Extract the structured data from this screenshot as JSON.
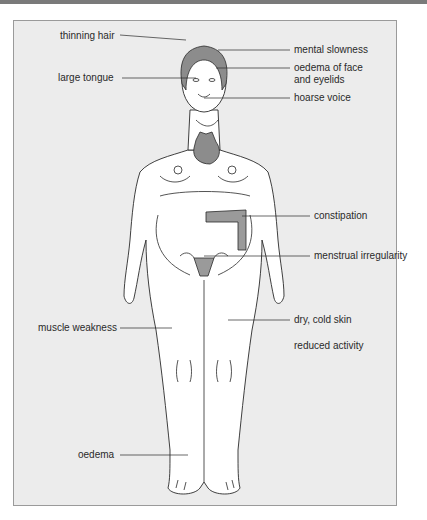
{
  "figure": {
    "colors": {
      "panel_bg": "#ececec",
      "body_fill": "#ffffff",
      "organ_fill": "#8c8c8c",
      "organ_light": "#c8c8c8",
      "line": "#2a2a2a",
      "top_bar": "#7a7a7a"
    },
    "labels": {
      "thinning_hair": "thinning hair",
      "large_tongue": "large tongue",
      "mental_slowness": "mental slowness",
      "oedema_face_1": "oedema of face",
      "oedema_face_2": "and eyelids",
      "hoarse_voice": "hoarse voice",
      "constipation": "constipation",
      "menstrual_irregularity": "menstrual irregularity",
      "muscle_weakness": "muscle weakness",
      "dry_cold_skin": "dry, cold skin",
      "reduced_activity": "reduced activity",
      "oedema": "oedema"
    }
  }
}
